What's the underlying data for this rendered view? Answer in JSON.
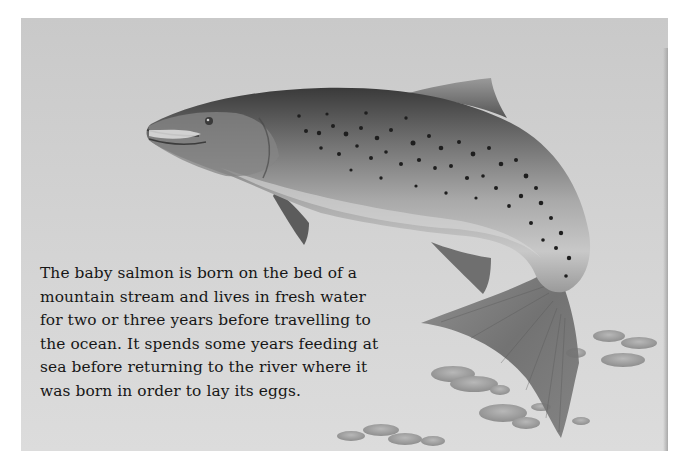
{
  "page": {
    "background_color": "#ffffff",
    "panel_color": "#d0d0d0"
  },
  "illustration": {
    "subject": "leaping-salmon",
    "elements": [
      "salmon",
      "river-pebbles"
    ]
  },
  "caption": {
    "lines": [
      "The baby salmon is born on the bed of a",
      "mountain stream and lives in fresh water",
      "for two or three years before travelling to",
      "the ocean. It spends some years feeding at",
      "sea before returning to the river where it",
      "was born in order to lay its eggs."
    ]
  }
}
